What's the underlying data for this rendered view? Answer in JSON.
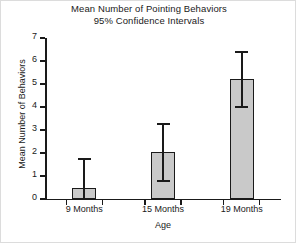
{
  "chart_data": {
    "type": "bar",
    "title": "Mean Number of Pointing Behaviors",
    "subtitle": "95% Confidence Intervals",
    "xlabel": "Age",
    "ylabel": "Mean Number of Behaviors",
    "categories": [
      "9 Months",
      "15 Months",
      "19 Months"
    ],
    "values": [
      0.5,
      2.05,
      5.2
    ],
    "error_low": [
      0.0,
      0.8,
      4.0
    ],
    "error_high": [
      1.75,
      3.25,
      6.4
    ],
    "ylim": [
      0,
      7
    ],
    "ytick_labels": [
      "0",
      "1",
      "2",
      "3",
      "4",
      "5",
      "6",
      "7"
    ],
    "ytick_values": [
      0,
      1,
      2,
      3,
      4,
      5,
      6,
      7
    ],
    "grid": false,
    "legend": null,
    "bar_fill_color": "#c9c9c9",
    "bar_edge_color": "#1a1a1a",
    "error_bar_color": "#1a1a1a",
    "background_color": "#ffffff"
  }
}
